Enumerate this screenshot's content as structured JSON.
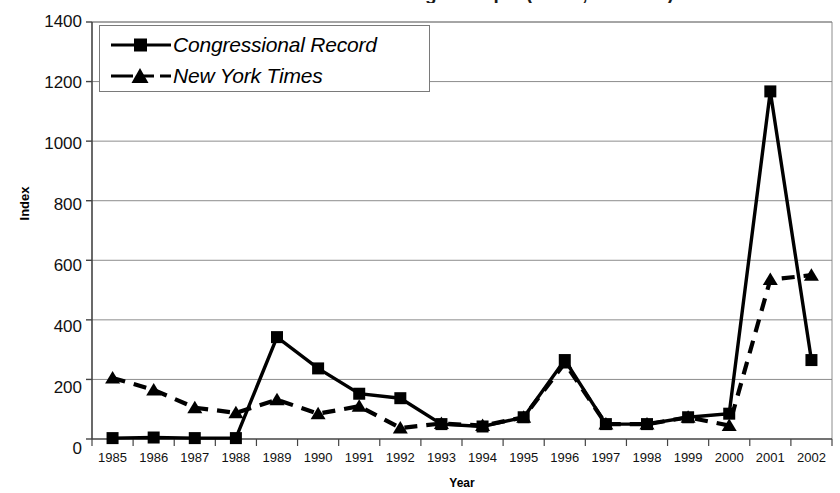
{
  "chart_data": {
    "type": "line",
    "title": "Number of stories mentioning the topic (Index, 1985 = 0)",
    "xlabel": "Year",
    "ylabel": "Index",
    "ylim": [
      0,
      1400
    ],
    "ytick_step": 200,
    "yticks": [
      0,
      200,
      400,
      600,
      800,
      1000,
      1200,
      1400
    ],
    "grid": true,
    "legend_position": "top-left",
    "categories": [
      "1985",
      "1986",
      "1987",
      "1988",
      "1989",
      "1990",
      "1991",
      "1992",
      "1993",
      "1994",
      "1995",
      "1996",
      "1997",
      "1998",
      "1999",
      "2000",
      "2001",
      "2002"
    ],
    "series": [
      {
        "name": "Congressional Record",
        "marker": "square",
        "line": "solid",
        "color": "#000000",
        "values": [
          3,
          5,
          3,
          3,
          342,
          237,
          152,
          137,
          50,
          42,
          73,
          265,
          50,
          50,
          73,
          85,
          1167,
          265
        ]
      },
      {
        "name": "New York Times",
        "marker": "triangle",
        "line": "dashed",
        "color": "#000000",
        "values": [
          205,
          165,
          105,
          88,
          132,
          85,
          110,
          37,
          52,
          45,
          73,
          255,
          50,
          50,
          73,
          45,
          535,
          550
        ]
      }
    ]
  },
  "axes": {
    "y_tick_labels": [
      "1400",
      "1200",
      "1000",
      "800",
      "600",
      "400",
      "200",
      "0"
    ],
    "x_tick_labels": [
      "1985",
      "1986",
      "1987",
      "1988",
      "1989",
      "1990",
      "1991",
      "1992",
      "1993",
      "1994",
      "1995",
      "1996",
      "1997",
      "1998",
      "1999",
      "2000",
      "2001",
      "2002"
    ]
  },
  "legend": {
    "items": [
      {
        "label": "Congressional Record",
        "marker": "square-marker",
        "style": "solid"
      },
      {
        "label": "New York Times",
        "marker": "triangle-marker",
        "style": "dashed"
      }
    ]
  }
}
